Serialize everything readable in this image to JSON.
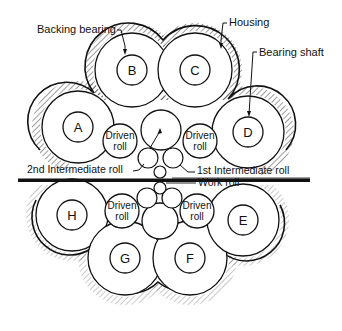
{
  "diagram": {
    "type": "cluster mill roll arrangement cross-section",
    "callouts": {
      "backing_bearing": "Backing bearing",
      "housing": "Housing",
      "bearing_shaft": "Bearing shaft",
      "second_intermediate_roll": "2nd Intermediate roll",
      "first_intermediate_roll": "1st Intermediate roll",
      "work_roll": "Work roll"
    },
    "backing_bearings": [
      {
        "id": "A",
        "label": "A"
      },
      {
        "id": "B",
        "label": "B"
      },
      {
        "id": "C",
        "label": "C"
      },
      {
        "id": "D",
        "label": "D"
      },
      {
        "id": "E",
        "label": "E"
      },
      {
        "id": "F",
        "label": "F"
      },
      {
        "id": "G",
        "label": "G"
      },
      {
        "id": "H",
        "label": "H"
      }
    ],
    "driven_rolls": [
      {
        "line1": "Driven",
        "line2": "roll"
      },
      {
        "line1": "Driven",
        "line2": "roll"
      },
      {
        "line1": "Driven",
        "line2": "roll"
      },
      {
        "line1": "Driven",
        "line2": "roll"
      }
    ],
    "colors": {
      "ink": "#111111",
      "background": "#ffffff"
    }
  }
}
